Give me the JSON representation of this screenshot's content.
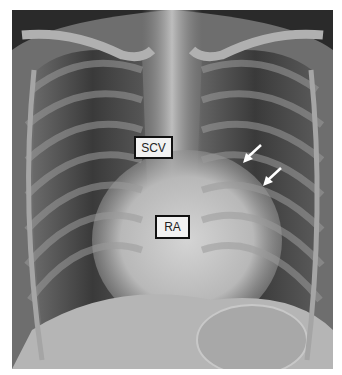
{
  "image": {
    "type": "chest-radiograph",
    "view": "frontal"
  },
  "labels": [
    {
      "text": "SCV"
    },
    {
      "text": "RA"
    }
  ],
  "annotations": {
    "arrows": [
      {
        "icon": "arrow-icon",
        "color": "#ffffff"
      },
      {
        "icon": "arrow-icon",
        "color": "#ffffff"
      }
    ]
  }
}
